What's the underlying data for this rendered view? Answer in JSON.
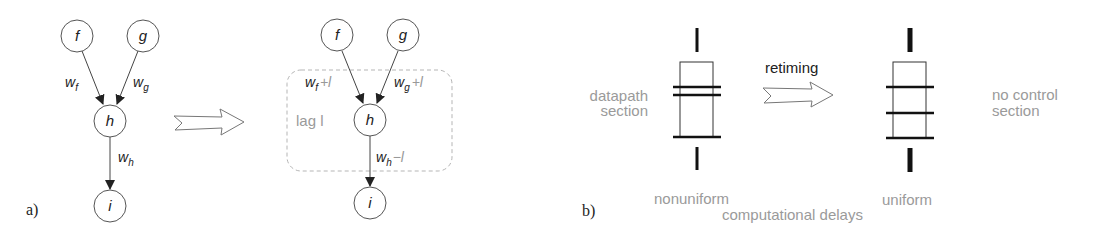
{
  "panel_a": {
    "label": "a)",
    "before": {
      "nodes": [
        {
          "id": "f",
          "label": "f"
        },
        {
          "id": "g",
          "label": "g"
        },
        {
          "id": "h",
          "label": "h"
        },
        {
          "id": "i",
          "label": "i"
        }
      ],
      "edges": [
        {
          "from": "f",
          "to": "h",
          "weight": "w",
          "sub": "f"
        },
        {
          "from": "g",
          "to": "h",
          "weight": "w",
          "sub": "g"
        },
        {
          "from": "h",
          "to": "i",
          "weight": "w",
          "sub": "h"
        }
      ]
    },
    "transform_arrow": "hollow-arrow",
    "after": {
      "nodes": [
        {
          "id": "f",
          "label": "f"
        },
        {
          "id": "g",
          "label": "g"
        },
        {
          "id": "h",
          "label": "h"
        },
        {
          "id": "i",
          "label": "i"
        }
      ],
      "edges": [
        {
          "from": "f",
          "to": "h",
          "weight": "w",
          "sub": "f",
          "mod": "+l"
        },
        {
          "from": "g",
          "to": "h",
          "weight": "w",
          "sub": "g",
          "mod": "+l"
        },
        {
          "from": "h",
          "to": "i",
          "weight": "w",
          "sub": "h",
          "mod": "−l"
        }
      ],
      "lag_box_label": "lag l"
    }
  },
  "panel_b": {
    "label": "b)",
    "left_label_line1": "datapath",
    "left_label_line2": "section",
    "arrow_label": "retiming",
    "right_label_line1": "no control",
    "right_label_line2": "section",
    "left_component_caption": "nonuniform",
    "right_component_caption": "uniform",
    "shared_caption": "computational delays"
  },
  "colors": {
    "stroke": "#333333",
    "gray_text": "#9a9a9a",
    "dashed_box": "#b5b5b5"
  }
}
